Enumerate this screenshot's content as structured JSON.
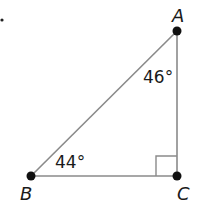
{
  "diagram": {
    "type": "right-triangle",
    "vertices": {
      "A": {
        "label": "A",
        "x": 177,
        "y": 31
      },
      "B": {
        "label": "B",
        "x": 31,
        "y": 176
      },
      "C": {
        "label": "C",
        "x": 177,
        "y": 176
      }
    },
    "angles": {
      "A": "46°",
      "B": "44°",
      "C": "right-angle"
    },
    "line_color": "#8a8a8a",
    "point_color": "#111111"
  }
}
